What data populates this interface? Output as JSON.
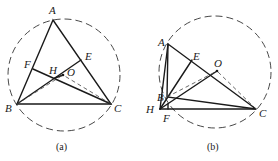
{
  "figures": [
    {
      "caption": "(a)",
      "circle": {
        "cx": 64,
        "cy": 75,
        "r": 56
      },
      "points": {
        "A": {
          "x": 53,
          "y": 20,
          "label": "A",
          "lx": 49,
          "ly": 14
        },
        "B": {
          "x": 17,
          "y": 104,
          "label": "B",
          "lx": 5,
          "ly": 112
        },
        "C": {
          "x": 111,
          "y": 104,
          "label": "C",
          "lx": 114,
          "ly": 112
        },
        "E": {
          "x": 81,
          "y": 60,
          "label": "E",
          "lx": 85,
          "ly": 60
        },
        "F": {
          "x": 33,
          "y": 69,
          "label": "F",
          "lx": 24,
          "ly": 68
        },
        "H": {
          "x": 55,
          "y": 78,
          "label": "H",
          "lx": 49,
          "ly": 74
        },
        "O": {
          "x": 63,
          "y": 75,
          "label": "O",
          "lx": 67,
          "ly": 76
        }
      }
    },
    {
      "caption": "(b)",
      "circle": {
        "cx": 215,
        "cy": 72,
        "r": 56
      },
      "points": {
        "A": {
          "x": 168,
          "y": 44,
          "label": "A",
          "lx": 158,
          "ly": 46
        },
        "B": {
          "x": 167,
          "y": 97,
          "label": "B",
          "lx": 157,
          "ly": 101
        },
        "C": {
          "x": 256,
          "y": 109,
          "label": "C",
          "lx": 259,
          "ly": 117
        },
        "E": {
          "x": 192,
          "y": 60,
          "label": "E",
          "lx": 193,
          "ly": 60
        },
        "F": {
          "x": 168,
          "y": 109,
          "label": "F",
          "lx": 163,
          "ly": 122
        },
        "H": {
          "x": 160,
          "y": 109,
          "label": "H",
          "lx": 146,
          "ly": 113
        },
        "O": {
          "x": 217,
          "y": 71,
          "label": "O",
          "lx": 214,
          "ly": 67
        }
      }
    }
  ]
}
